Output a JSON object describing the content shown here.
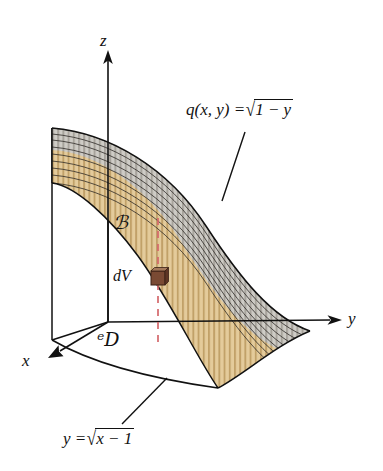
{
  "figure": {
    "background": "#ffffff",
    "line_color": "#111111",
    "dashed_color": "#d4686b",
    "mesh_gray": "#b9b6b0",
    "mesh_tan": "#d9bc8a",
    "cube_color": "#7a4a33"
  },
  "axes": [
    {
      "name": "z",
      "label": "z",
      "direction": "up"
    },
    {
      "name": "y",
      "label": "y",
      "direction": "right"
    },
    {
      "name": "x",
      "label": "x",
      "direction": "down-left"
    }
  ],
  "labels": {
    "solid_region": "ℬ",
    "domain_region": "ᵉD",
    "volume_element": "dV"
  },
  "equations": {
    "surface": {
      "lhs": "q(x, y) =",
      "radical_body": "1 − y",
      "full": "q(x, y) = √(1 − y)"
    },
    "boundary_curve": {
      "lhs": "y =",
      "radical_body": "x − 1",
      "full": "y = √(x − 1)"
    }
  },
  "geometry": {
    "origin": [
      108,
      322
    ],
    "z_axis_tip": [
      108,
      52
    ],
    "y_axis_tip": [
      340,
      320
    ],
    "x_axis_tip": [
      50,
      355
    ],
    "dashed_line_x": 158,
    "dashed_line_top_y": 218,
    "dashed_line_bottom_y": 348,
    "cube_center": [
      158,
      278
    ]
  }
}
